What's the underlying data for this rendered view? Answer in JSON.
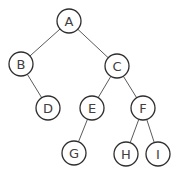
{
  "diagram": {
    "type": "binary-tree",
    "node_radius": 12,
    "colors": {
      "edge": "#5a5a5a",
      "node_stroke": "#2e2e2e",
      "node_fill": "#ffffff",
      "label": "#404040",
      "background": "#ffffff"
    },
    "nodes": [
      {
        "id": "A",
        "label": "A",
        "x": 69,
        "y": 21
      },
      {
        "id": "B",
        "label": "B",
        "x": 21,
        "y": 64
      },
      {
        "id": "C",
        "label": "C",
        "x": 117,
        "y": 66
      },
      {
        "id": "D",
        "label": "D",
        "x": 48,
        "y": 108
      },
      {
        "id": "E",
        "label": "E",
        "x": 92,
        "y": 108
      },
      {
        "id": "F",
        "label": "F",
        "x": 143,
        "y": 108
      },
      {
        "id": "G",
        "label": "G",
        "x": 74,
        "y": 153
      },
      {
        "id": "H",
        "label": "H",
        "x": 126,
        "y": 154
      },
      {
        "id": "I",
        "label": "I",
        "x": 158,
        "y": 154
      }
    ],
    "edges": [
      {
        "from": "A",
        "to": "B"
      },
      {
        "from": "A",
        "to": "C"
      },
      {
        "from": "B",
        "to": "D"
      },
      {
        "from": "C",
        "to": "E"
      },
      {
        "from": "C",
        "to": "F"
      },
      {
        "from": "E",
        "to": "G"
      },
      {
        "from": "F",
        "to": "H"
      },
      {
        "from": "F",
        "to": "I"
      }
    ]
  }
}
